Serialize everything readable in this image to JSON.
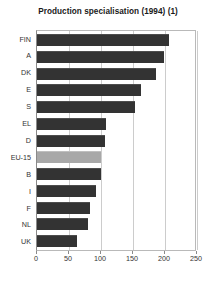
{
  "chart_data": {
    "type": "bar",
    "orientation": "horizontal",
    "title": "Production specialisation (1994) (1)",
    "xlabel": "",
    "ylabel": "",
    "categories": [
      "FIN",
      "A",
      "DK",
      "E",
      "S",
      "EL",
      "D",
      "EU-15",
      "B",
      "I",
      "F",
      "NL",
      "UK"
    ],
    "values": [
      206,
      198,
      186,
      163,
      153,
      108,
      107,
      100,
      100,
      92,
      83,
      80,
      62
    ],
    "xlim": [
      0,
      250
    ],
    "xticks": [
      0,
      50,
      100,
      150,
      200,
      250
    ],
    "xtick_labels": [
      "0",
      "50",
      "100",
      "150",
      "200",
      "250"
    ],
    "grid": true,
    "legend": null,
    "highlight_category": "EU-15",
    "colors": {
      "bar": "#333333",
      "bar_highlight": "#a8a8a8",
      "gridline": "#cccccc",
      "axis": "#8a8a8a",
      "text": "#333333",
      "title": "#1a1a1a",
      "background": "#ffffff"
    }
  }
}
